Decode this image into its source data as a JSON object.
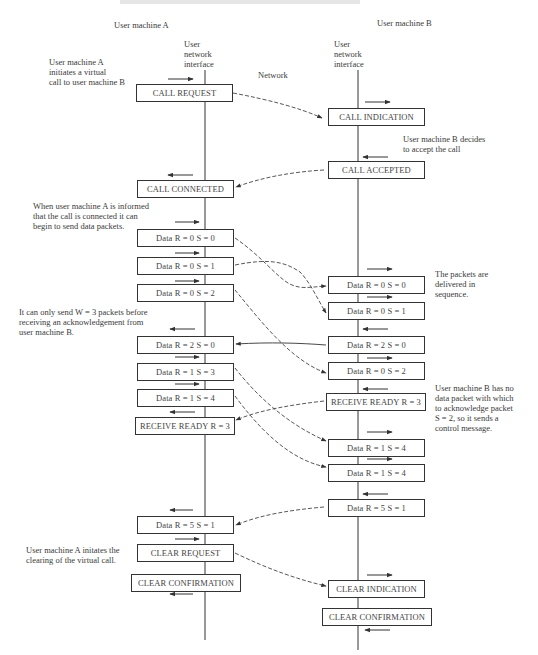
{
  "headers": {
    "machine_a": "User machine A",
    "machine_b": "User machine B",
    "interface_a": "User\nnetwork\ninterface",
    "interface_b": "User\nnetwork\ninterface",
    "network": "Network"
  },
  "annotations": {
    "a_initiates": "User machine A\ninitiates a virtual\ncall to user machine B",
    "b_decides": "User machine B decides\nto accept the call",
    "a_informed": "When user machine A is informed\nthat the call is connected it can\nbegin to send data packets.",
    "delivered": "The packets are\ndelivered in\nsequence.",
    "window": "It can only send W = 3 packets before\nreceiving an acknowledgement from\nuser machine B.",
    "b_no_data": "User machine B has no\ndata packet with which\nto acknowledge packet\nS = 2, so it sends a\ncontrol message.",
    "a_clears": "User machine A initates the\nclearing of the virtual call."
  },
  "side_a": [
    {
      "id": "a_call_request",
      "label": "CALL REQUEST"
    },
    {
      "id": "a_call_connected",
      "label": "CALL CONNECTED"
    },
    {
      "id": "a_d00",
      "label": "Data R = 0  S = 0"
    },
    {
      "id": "a_d01",
      "label": "Data R = 0  S = 1"
    },
    {
      "id": "a_d02",
      "label": "Data R = 0  S = 2"
    },
    {
      "id": "a_d20",
      "label": "Data R = 2  S = 0"
    },
    {
      "id": "a_d13",
      "label": "Data R = 1  S = 3"
    },
    {
      "id": "a_d14",
      "label": "Data R = 1  S = 4"
    },
    {
      "id": "a_rr3",
      "label": "RECEIVE READY R = 3"
    },
    {
      "id": "a_d51",
      "label": "Data R = 5  S = 1"
    },
    {
      "id": "a_clear_request",
      "label": "CLEAR REQUEST"
    },
    {
      "id": "a_clear_confirmation",
      "label": "CLEAR CONFIRMATION"
    }
  ],
  "side_b": [
    {
      "id": "b_call_indication",
      "label": "CALL INDICATION"
    },
    {
      "id": "b_call_accepted",
      "label": "CALL ACCEPTED"
    },
    {
      "id": "b_d00",
      "label": "Data R = 0  S = 0"
    },
    {
      "id": "b_d01",
      "label": "Data R = 0  S = 1"
    },
    {
      "id": "b_d20",
      "label": "Data R = 2  S = 0"
    },
    {
      "id": "b_d02",
      "label": "Data R = 0  S = 2"
    },
    {
      "id": "b_rr3",
      "label": "RECEIVE READY R = 3"
    },
    {
      "id": "b_d14a",
      "label": "Data R = 1  S = 4"
    },
    {
      "id": "b_d14b",
      "label": "Data R = 1  S = 4"
    },
    {
      "id": "b_d51",
      "label": "Data R = 5  S = 1"
    },
    {
      "id": "b_clear_indication",
      "label": "CLEAR INDICATION"
    },
    {
      "id": "b_clear_confirmation",
      "label": "CLEAR CONFIRMATION"
    }
  ],
  "colors": {
    "line": "#333333",
    "text": "#3a3a3a",
    "background": "#ffffff"
  }
}
